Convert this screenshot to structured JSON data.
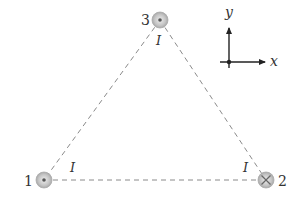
{
  "diagram": {
    "wires": [
      {
        "id": "1",
        "label": "1",
        "direction": "out-of-page",
        "symbol": "dot",
        "current_label": "I"
      },
      {
        "id": "2",
        "label": "2",
        "direction": "into-page",
        "symbol": "cross",
        "current_label": "I"
      },
      {
        "id": "3",
        "label": "3",
        "direction": "out-of-page",
        "symbol": "dot",
        "current_label": "I"
      }
    ],
    "axes": {
      "x_label": "x",
      "y_label": "y"
    },
    "colors": {
      "wire_fill": "#c8c8c8",
      "wire_stroke": "#9a9a9a",
      "dashed_line": "#8a8a8a",
      "axis": "#222222",
      "text": "#333333"
    }
  }
}
